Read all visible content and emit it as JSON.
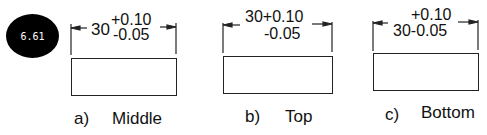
{
  "badge": {
    "label": "6.61"
  },
  "figures": [
    {
      "nominal": "30",
      "upper": "+0.10",
      "lower": "-0.05",
      "caption_letter": "a)",
      "caption": "Middle"
    },
    {
      "line1": "30+0.10",
      "line2": "-0.05",
      "caption_letter": "b)",
      "caption": "Top"
    },
    {
      "line1": "+0.10",
      "line2": "30-0.05",
      "caption_letter": "c)",
      "caption": "Bottom"
    }
  ]
}
